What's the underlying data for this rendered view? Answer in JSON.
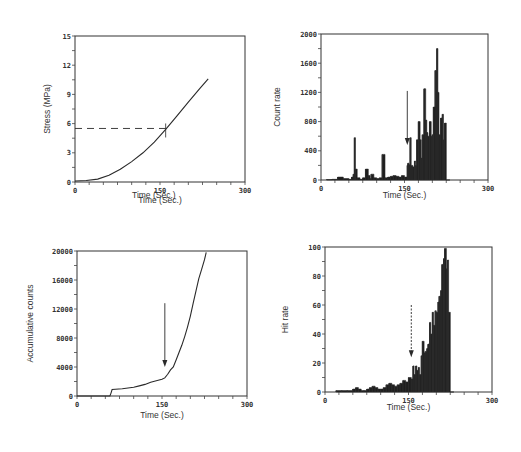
{
  "chart_data": [
    {
      "id": "stress",
      "type": "line",
      "title": "",
      "xlabel": "Time (Sec.)",
      "ylabel": "Stress (MPa)",
      "xlim": [
        0,
        300
      ],
      "ylim": [
        0,
        15
      ],
      "xticks": [
        0,
        150,
        300
      ],
      "yticks": [
        0,
        3,
        6,
        9,
        12,
        15
      ],
      "ytick_labels": [
        "0",
        "3",
        "6",
        "9",
        "12",
        "15"
      ],
      "xtick_labels": [
        "0",
        "150",
        "300"
      ],
      "grid": false,
      "series": [
        {
          "name": "Stress",
          "x": [
            0,
            20,
            40,
            60,
            80,
            100,
            120,
            140,
            160,
            180,
            200,
            220,
            235
          ],
          "y": [
            0.1,
            0.15,
            0.3,
            0.7,
            1.3,
            2.1,
            3.0,
            4.1,
            5.4,
            6.8,
            8.2,
            9.6,
            10.6
          ]
        }
      ],
      "annotations": [
        {
          "type": "dashed-hline",
          "y": 5.5,
          "x_from": 0,
          "x_to": 160
        },
        {
          "type": "marker-tick",
          "x": 160,
          "y": 5.5
        }
      ]
    },
    {
      "id": "count-rate",
      "type": "bar",
      "title": "",
      "xlabel": "Time (Sec.)",
      "ylabel": "Count rate",
      "xlim": [
        0,
        300
      ],
      "ylim": [
        0,
        2000
      ],
      "xticks": [
        0,
        150,
        300
      ],
      "yticks": [
        0,
        400,
        800,
        1200,
        1600,
        2000
      ],
      "ytick_labels": [
        "0",
        "400",
        "800",
        "1200",
        "1600",
        "2000"
      ],
      "xtick_labels": [
        "0",
        "150",
        "300"
      ],
      "grid": false,
      "x": [
        10,
        20,
        30,
        40,
        50,
        55,
        58,
        60,
        62,
        65,
        70,
        75,
        80,
        85,
        88,
        90,
        95,
        100,
        105,
        110,
        115,
        120,
        125,
        130,
        135,
        140,
        145,
        150,
        155,
        156,
        158,
        160,
        162,
        165,
        168,
        170,
        172,
        175,
        178,
        180,
        182,
        185,
        188,
        190,
        192,
        195,
        198,
        200,
        202,
        205,
        208,
        210,
        212,
        215,
        218,
        220,
        222,
        225,
        228
      ],
      "values": [
        5,
        10,
        40,
        20,
        10,
        40,
        80,
        580,
        150,
        30,
        10,
        30,
        150,
        60,
        20,
        80,
        30,
        20,
        30,
        350,
        30,
        40,
        50,
        60,
        50,
        40,
        60,
        40,
        200,
        230,
        210,
        580,
        200,
        180,
        260,
        200,
        550,
        800,
        550,
        300,
        620,
        1250,
        820,
        650,
        600,
        800,
        600,
        620,
        1000,
        1500,
        1800,
        1200,
        620,
        850,
        900,
        550,
        780,
        0,
        0
      ],
      "annotations": [
        {
          "type": "arrow-down",
          "x": 155,
          "y_from": 1220,
          "y_to": 480
        }
      ]
    },
    {
      "id": "accumulative-counts",
      "type": "line",
      "title": "",
      "xlabel": "Time (Sec.)",
      "ylabel": "Accumulative counts",
      "xlim": [
        0,
        300
      ],
      "ylim": [
        0,
        20000
      ],
      "xticks": [
        0,
        150,
        300
      ],
      "yticks": [
        0,
        4000,
        8000,
        12000,
        16000,
        20000
      ],
      "ytick_labels": [
        "0",
        "4000",
        "8000",
        "12000",
        "16000",
        "20000"
      ],
      "xtick_labels": [
        "0",
        "150",
        "300"
      ],
      "grid": false,
      "series": [
        {
          "name": "Accumulative counts",
          "x": [
            0,
            30,
            58,
            60,
            62,
            80,
            100,
            110,
            120,
            130,
            140,
            150,
            155,
            160,
            165,
            170,
            175,
            180,
            185,
            190,
            195,
            200,
            205,
            210,
            215,
            220,
            225,
            228
          ],
          "y": [
            0,
            0,
            0,
            400,
            900,
            1000,
            1200,
            1400,
            1600,
            1900,
            2100,
            2300,
            2500,
            3000,
            3600,
            4000,
            5000,
            6000,
            7000,
            8200,
            9500,
            11000,
            12800,
            14500,
            16200,
            17500,
            18800,
            19800
          ]
        }
      ],
      "annotations": [
        {
          "type": "arrow-down",
          "x": 155,
          "y_from": 12800,
          "y_to": 4000
        }
      ]
    },
    {
      "id": "hit-rate",
      "type": "bar",
      "title": "",
      "xlabel": "Time (Sec.)",
      "ylabel": "Hit rate",
      "xlim": [
        0,
        300
      ],
      "ylim": [
        0,
        100
      ],
      "xticks": [
        0,
        150,
        300
      ],
      "yticks": [
        0,
        20,
        40,
        60,
        80,
        100
      ],
      "ytick_labels": [
        "0",
        "20",
        "40",
        "60",
        "80",
        "100"
      ],
      "xtick_labels": [
        "0",
        "150",
        "300"
      ],
      "grid": false,
      "x": [
        20,
        30,
        40,
        50,
        55,
        60,
        65,
        70,
        75,
        80,
        85,
        90,
        95,
        100,
        105,
        110,
        115,
        120,
        125,
        130,
        135,
        140,
        145,
        150,
        155,
        158,
        160,
        163,
        165,
        168,
        170,
        173,
        175,
        178,
        180,
        183,
        185,
        188,
        190,
        193,
        195,
        198,
        200,
        203,
        205,
        208,
        210,
        213,
        215,
        218,
        220,
        222,
        225,
        228
      ],
      "values": [
        1,
        1,
        1,
        2,
        3,
        2,
        1,
        1,
        2,
        3,
        4,
        3,
        2,
        2,
        3,
        5,
        6,
        5,
        4,
        5,
        6,
        8,
        7,
        10,
        9,
        18,
        12,
        18,
        15,
        17,
        12,
        25,
        35,
        27,
        28,
        30,
        33,
        48,
        40,
        55,
        46,
        56,
        55,
        62,
        66,
        70,
        88,
        92,
        99,
        85,
        91,
        55,
        0,
        0
      ],
      "annotations": [
        {
          "type": "arrow-down-dotted",
          "x": 155,
          "y_from": 60,
          "y_to": 24
        }
      ]
    }
  ],
  "panels": {
    "stress": {
      "xlabel": "Time (Sec.)",
      "ylabel": "Stress (MPa)"
    },
    "count_rate": {
      "xlabel": "Time (Sec.)",
      "ylabel": "Count rate"
    },
    "accumulative": {
      "xlabel": "Time (Sec.)",
      "ylabel": "Accumulative counts"
    },
    "hit_rate": {
      "xlabel": "Time (Sec.)",
      "ylabel": "Hit rate"
    }
  },
  "colors": {
    "ink": "#2a2a2a",
    "fill": "#1e1e1e",
    "background": "#ffffff"
  }
}
